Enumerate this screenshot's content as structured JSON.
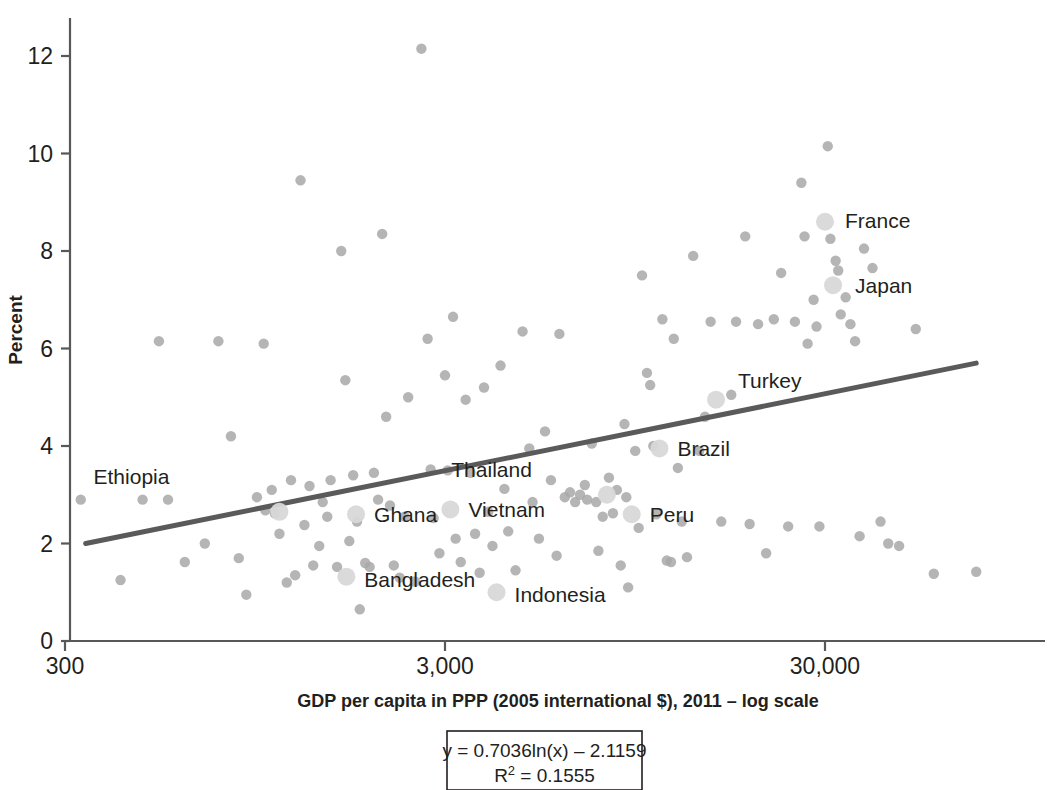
{
  "chart_data": {
    "type": "scatter",
    "title": "",
    "xlabel": "GDP per capita in PPP (2005 international $), 2011 – log scale",
    "ylabel": "Percent",
    "xscale": "log",
    "xlim": [
      300,
      100000
    ],
    "ylim": [
      0,
      13
    ],
    "xticks": [
      "300",
      "3,000",
      "30,000"
    ],
    "xtick_values": [
      300,
      3000,
      30000
    ],
    "yticks": [
      "0",
      "2",
      "4",
      "6",
      "8",
      "10",
      "12"
    ],
    "ytick_values": [
      0,
      2,
      4,
      6,
      8,
      10,
      12
    ],
    "grid": false,
    "legend": null,
    "marker_color": "#a8a8a8",
    "highlight_marker_color": "#d8d8d8",
    "trendline_color": "#5a5a5a",
    "axis_color": "#58585a",
    "trendline": {
      "equation": "y = 0.7036ln(x) – 2.1159",
      "r2_label": "R",
      "r2_sup": "2",
      "r2_value": " = 0.1555",
      "slope": 0.7036,
      "intercept": -2.1159,
      "r_squared": 0.1555,
      "x_start": 340,
      "x_end": 75000,
      "y_start": 2.0,
      "y_end": 5.7
    },
    "labeled_points": [
      {
        "name": "Ethiopia",
        "x": 1100,
        "y": 2.65,
        "label_dx": -110,
        "label_dy": -28
      },
      {
        "name": "Ghana",
        "x": 1750,
        "y": 2.6,
        "label_dx": 18,
        "label_dy": 8
      },
      {
        "name": "Vietnam",
        "x": 3100,
        "y": 2.7,
        "label_dx": 18,
        "label_dy": 8
      },
      {
        "name": "Bangladesh",
        "x": 1650,
        "y": 1.32,
        "label_dx": 18,
        "label_dy": 10
      },
      {
        "name": "Indonesia",
        "x": 4100,
        "y": 1.0,
        "label_dx": 18,
        "label_dy": 10
      },
      {
        "name": "Thailand",
        "x": 8000,
        "y": 3.0,
        "label_dx": -75,
        "label_dy": -18
      },
      {
        "name": "Peru",
        "x": 9300,
        "y": 2.6,
        "label_dx": 18,
        "label_dy": 8
      },
      {
        "name": "Brazil",
        "x": 11000,
        "y": 3.95,
        "label_dx": 18,
        "label_dy": 8
      },
      {
        "name": "Turkey",
        "x": 15500,
        "y": 4.95,
        "label_dx": 22,
        "label_dy": -12
      },
      {
        "name": "France",
        "x": 30000,
        "y": 8.6,
        "label_dx": 20,
        "label_dy": 6
      },
      {
        "name": "Japan",
        "x": 31500,
        "y": 7.3,
        "label_dx": 22,
        "label_dy": 8
      }
    ],
    "points": [
      {
        "x": 330,
        "y": 2.9
      },
      {
        "x": 420,
        "y": 1.25
      },
      {
        "x": 480,
        "y": 2.9
      },
      {
        "x": 530,
        "y": 6.15
      },
      {
        "x": 560,
        "y": 2.9
      },
      {
        "x": 620,
        "y": 1.62
      },
      {
        "x": 700,
        "y": 2.0
      },
      {
        "x": 760,
        "y": 6.15
      },
      {
        "x": 820,
        "y": 4.2
      },
      {
        "x": 860,
        "y": 1.7
      },
      {
        "x": 900,
        "y": 0.95
      },
      {
        "x": 960,
        "y": 2.95
      },
      {
        "x": 1000,
        "y": 6.1
      },
      {
        "x": 1010,
        "y": 2.68
      },
      {
        "x": 1050,
        "y": 3.1
      },
      {
        "x": 1070,
        "y": 2.62
      },
      {
        "x": 1100,
        "y": 2.2
      },
      {
        "x": 1150,
        "y": 1.2
      },
      {
        "x": 1180,
        "y": 3.3
      },
      {
        "x": 1210,
        "y": 1.35
      },
      {
        "x": 1250,
        "y": 9.45
      },
      {
        "x": 1280,
        "y": 2.38
      },
      {
        "x": 1320,
        "y": 3.18
      },
      {
        "x": 1350,
        "y": 1.55
      },
      {
        "x": 1400,
        "y": 1.95
      },
      {
        "x": 1430,
        "y": 2.85
      },
      {
        "x": 1470,
        "y": 2.55
      },
      {
        "x": 1500,
        "y": 3.3
      },
      {
        "x": 1560,
        "y": 1.52
      },
      {
        "x": 1600,
        "y": 8.0
      },
      {
        "x": 1640,
        "y": 5.35
      },
      {
        "x": 1680,
        "y": 2.05
      },
      {
        "x": 1720,
        "y": 3.4
      },
      {
        "x": 1760,
        "y": 2.45
      },
      {
        "x": 1790,
        "y": 0.65
      },
      {
        "x": 1850,
        "y": 1.6
      },
      {
        "x": 1900,
        "y": 1.52
      },
      {
        "x": 1950,
        "y": 3.45
      },
      {
        "x": 2000,
        "y": 2.9
      },
      {
        "x": 2050,
        "y": 8.35
      },
      {
        "x": 2100,
        "y": 4.6
      },
      {
        "x": 2150,
        "y": 2.78
      },
      {
        "x": 2200,
        "y": 1.55
      },
      {
        "x": 2280,
        "y": 1.3
      },
      {
        "x": 2350,
        "y": 2.55
      },
      {
        "x": 2400,
        "y": 5.0
      },
      {
        "x": 2500,
        "y": 1.22
      },
      {
        "x": 2600,
        "y": 12.15
      },
      {
        "x": 2700,
        "y": 6.2
      },
      {
        "x": 2750,
        "y": 3.52
      },
      {
        "x": 2800,
        "y": 2.52
      },
      {
        "x": 2900,
        "y": 1.8
      },
      {
        "x": 3000,
        "y": 5.45
      },
      {
        "x": 3050,
        "y": 3.5
      },
      {
        "x": 3150,
        "y": 6.65
      },
      {
        "x": 3200,
        "y": 2.1
      },
      {
        "x": 3300,
        "y": 1.62
      },
      {
        "x": 3400,
        "y": 4.95
      },
      {
        "x": 3500,
        "y": 3.45
      },
      {
        "x": 3600,
        "y": 2.2
      },
      {
        "x": 3700,
        "y": 1.4
      },
      {
        "x": 3800,
        "y": 5.2
      },
      {
        "x": 3900,
        "y": 2.65
      },
      {
        "x": 4000,
        "y": 1.95
      },
      {
        "x": 4200,
        "y": 5.65
      },
      {
        "x": 4300,
        "y": 3.12
      },
      {
        "x": 4400,
        "y": 2.25
      },
      {
        "x": 4600,
        "y": 1.45
      },
      {
        "x": 4800,
        "y": 6.35
      },
      {
        "x": 5000,
        "y": 3.95
      },
      {
        "x": 5100,
        "y": 2.85
      },
      {
        "x": 5300,
        "y": 2.1
      },
      {
        "x": 5500,
        "y": 4.3
      },
      {
        "x": 5700,
        "y": 3.3
      },
      {
        "x": 5900,
        "y": 1.75
      },
      {
        "x": 6000,
        "y": 6.3
      },
      {
        "x": 6200,
        "y": 2.95
      },
      {
        "x": 6400,
        "y": 3.05
      },
      {
        "x": 6600,
        "y": 2.85
      },
      {
        "x": 6800,
        "y": 3.0
      },
      {
        "x": 7000,
        "y": 3.2
      },
      {
        "x": 7100,
        "y": 2.9
      },
      {
        "x": 7300,
        "y": 4.05
      },
      {
        "x": 7500,
        "y": 2.85
      },
      {
        "x": 7600,
        "y": 1.85
      },
      {
        "x": 7800,
        "y": 2.55
      },
      {
        "x": 8100,
        "y": 3.35
      },
      {
        "x": 8300,
        "y": 2.62
      },
      {
        "x": 8500,
        "y": 3.1
      },
      {
        "x": 8700,
        "y": 1.55
      },
      {
        "x": 8900,
        "y": 4.45
      },
      {
        "x": 9000,
        "y": 2.95
      },
      {
        "x": 9100,
        "y": 1.1
      },
      {
        "x": 9500,
        "y": 3.9
      },
      {
        "x": 9700,
        "y": 2.32
      },
      {
        "x": 9900,
        "y": 7.5
      },
      {
        "x": 10200,
        "y": 5.5
      },
      {
        "x": 10400,
        "y": 5.25
      },
      {
        "x": 10600,
        "y": 4.0
      },
      {
        "x": 10800,
        "y": 2.6
      },
      {
        "x": 11200,
        "y": 6.6
      },
      {
        "x": 11500,
        "y": 1.65
      },
      {
        "x": 11800,
        "y": 1.62
      },
      {
        "x": 12000,
        "y": 6.2
      },
      {
        "x": 12300,
        "y": 3.55
      },
      {
        "x": 12600,
        "y": 2.45
      },
      {
        "x": 13000,
        "y": 1.72
      },
      {
        "x": 13500,
        "y": 7.9
      },
      {
        "x": 14000,
        "y": 3.9
      },
      {
        "x": 14500,
        "y": 4.6
      },
      {
        "x": 15000,
        "y": 6.55
      },
      {
        "x": 16000,
        "y": 2.45
      },
      {
        "x": 17000,
        "y": 5.05
      },
      {
        "x": 17500,
        "y": 6.55
      },
      {
        "x": 18500,
        "y": 8.3
      },
      {
        "x": 19000,
        "y": 2.4
      },
      {
        "x": 20000,
        "y": 6.5
      },
      {
        "x": 21000,
        "y": 1.8
      },
      {
        "x": 22000,
        "y": 6.6
      },
      {
        "x": 23000,
        "y": 7.55
      },
      {
        "x": 24000,
        "y": 2.35
      },
      {
        "x": 25000,
        "y": 6.55
      },
      {
        "x": 26000,
        "y": 9.4
      },
      {
        "x": 26500,
        "y": 8.3
      },
      {
        "x": 27000,
        "y": 6.1
      },
      {
        "x": 28000,
        "y": 7.0
      },
      {
        "x": 28500,
        "y": 6.45
      },
      {
        "x": 29000,
        "y": 2.35
      },
      {
        "x": 30500,
        "y": 10.15
      },
      {
        "x": 31000,
        "y": 8.25
      },
      {
        "x": 32000,
        "y": 7.8
      },
      {
        "x": 32500,
        "y": 7.6
      },
      {
        "x": 33000,
        "y": 6.7
      },
      {
        "x": 34000,
        "y": 7.05
      },
      {
        "x": 35000,
        "y": 6.5
      },
      {
        "x": 36000,
        "y": 6.15
      },
      {
        "x": 37000,
        "y": 2.15
      },
      {
        "x": 38000,
        "y": 8.05
      },
      {
        "x": 40000,
        "y": 7.65
      },
      {
        "x": 42000,
        "y": 2.45
      },
      {
        "x": 44000,
        "y": 2.0
      },
      {
        "x": 47000,
        "y": 1.95
      },
      {
        "x": 52000,
        "y": 6.4
      },
      {
        "x": 58000,
        "y": 1.38
      },
      {
        "x": 75000,
        "y": 1.42
      }
    ]
  }
}
